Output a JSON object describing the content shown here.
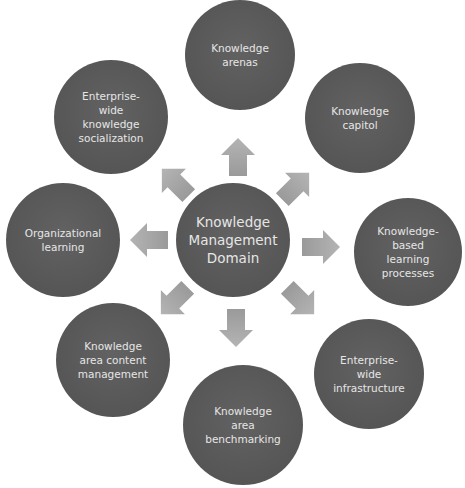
{
  "diagram": {
    "type": "hub-and-spoke",
    "colors": {
      "node_fill": "#5a5a5a",
      "node_text": "#e6e6e6",
      "arrow_fill": "#a6a6a6",
      "background": "#ffffff"
    },
    "center": {
      "label_lines": [
        "Knowledge",
        "Management",
        "Domain"
      ]
    },
    "nodes": [
      {
        "id": "top",
        "direction": "up",
        "label_lines": [
          "Knowledge",
          "arenas"
        ]
      },
      {
        "id": "top-right",
        "direction": "up-right",
        "label_lines": [
          "Knowledge",
          "capitol"
        ]
      },
      {
        "id": "right",
        "direction": "right",
        "label_lines": [
          "Knowledge-",
          "based",
          "learning",
          "processes"
        ]
      },
      {
        "id": "bottom-right",
        "direction": "down-right",
        "label_lines": [
          "Enterprise-",
          "wide",
          "infrastructure"
        ]
      },
      {
        "id": "bottom",
        "direction": "down",
        "label_lines": [
          "Knowledge",
          "area",
          "benchmarking"
        ]
      },
      {
        "id": "bottom-left",
        "direction": "down-left",
        "label_lines": [
          "Knowledge",
          "area content",
          "management"
        ]
      },
      {
        "id": "left",
        "direction": "left",
        "label_lines": [
          "Organizational",
          "learning"
        ]
      },
      {
        "id": "top-left",
        "direction": "up-left",
        "label_lines": [
          "Enterprise-",
          "wide",
          "knowledge",
          "socialization"
        ]
      }
    ]
  }
}
